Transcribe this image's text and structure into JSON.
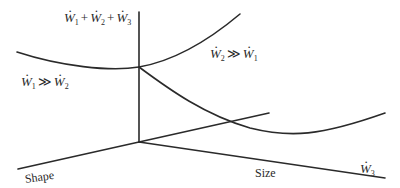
{
  "diagram": {
    "labels": {
      "total": {
        "w1": "W",
        "s1": "1",
        "plus1": "+",
        "w2": "W",
        "s2": "2",
        "plus2": "+",
        "w3": "W",
        "s3": "3"
      },
      "left_regime": {
        "a": "W",
        "sa": "1",
        "op": "≫",
        "b": "W",
        "sb": "2"
      },
      "right_regime": {
        "a": "W",
        "sa": "2",
        "op": "≫",
        "b": "W",
        "sb": "1"
      },
      "axis_w3": {
        "w": "W",
        "s": "3"
      },
      "axis_shape": "Shape",
      "axis_size": "Size"
    },
    "colors": {
      "line": "#2a2a2a",
      "background": "#ffffff"
    }
  }
}
